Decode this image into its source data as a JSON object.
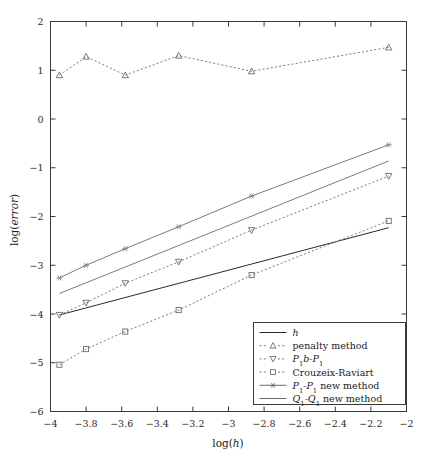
{
  "chart_data": {
    "type": "line",
    "title": "",
    "xlabel": "log(h)",
    "ylabel": "log(error)",
    "xlim": [
      -4,
      -2
    ],
    "ylim": [
      -6,
      2
    ],
    "xticks": [
      -4,
      -3.8,
      -3.6,
      -3.4,
      -3.2,
      -3,
      -2.8,
      -2.6,
      -2.4,
      -2.2,
      -2
    ],
    "xticklabels": [
      "-4",
      "-3.8",
      "-3.6",
      "-3.4",
      "-3.2",
      "-3",
      "-2.8",
      "-2.6",
      "-2.4",
      "-2.2",
      "-2"
    ],
    "yticks": [
      -6,
      -5,
      -4,
      -3,
      -2,
      -1,
      0,
      1,
      2
    ],
    "yticklabels": [
      "-6",
      "-5",
      "-4",
      "-3",
      "-2",
      "-1",
      "0",
      "1",
      "2"
    ],
    "grid": false,
    "legend_position": "lower right",
    "series": [
      {
        "name": "h",
        "label_plain": "h",
        "style": "solid",
        "marker": "none",
        "color": "#2b2b2b",
        "x": [
          -3.95,
          -2.1
        ],
        "y": [
          -4.02,
          -2.23
        ]
      },
      {
        "name": "penalty method",
        "label_plain": "penalty method",
        "style": "dashed",
        "marker": "triangle-up",
        "color": "#6b6b6b",
        "x": [
          -3.95,
          -3.8,
          -3.58,
          -3.28,
          -2.87,
          -2.1
        ],
        "y": [
          0.9,
          1.28,
          0.9,
          1.3,
          0.98,
          1.47
        ]
      },
      {
        "name": "P1b-P1",
        "label_plain": "P1b-P1",
        "style": "dashed",
        "marker": "triangle-down",
        "color": "#6b6b6b",
        "x": [
          -3.95,
          -3.8,
          -3.58,
          -3.28,
          -2.87,
          -2.1
        ],
        "y": [
          -4.02,
          -3.77,
          -3.37,
          -2.93,
          -2.28,
          -1.17
        ]
      },
      {
        "name": "Crouzeix-Raviart",
        "label_plain": "Crouzeix-Raviart",
        "style": "dashed",
        "marker": "square",
        "color": "#6b6b6b",
        "x": [
          -3.95,
          -3.8,
          -3.58,
          -3.28,
          -2.87,
          -2.1
        ],
        "y": [
          -5.04,
          -4.72,
          -4.36,
          -3.92,
          -3.2,
          -2.09
        ]
      },
      {
        "name": "P1-P1 new method",
        "label_plain": "P1-P1 new method",
        "style": "solid",
        "marker": "asterisk",
        "color": "#7a7a7a",
        "x": [
          -3.95,
          -3.8,
          -3.58,
          -3.28,
          -2.87,
          -2.1
        ],
        "y": [
          -3.26,
          -3.0,
          -2.66,
          -2.21,
          -1.58,
          -0.53
        ]
      },
      {
        "name": "Q1-Q1 new method",
        "label_plain": "Q1-Q1 new method",
        "style": "solid",
        "marker": "none",
        "color": "#7a7a7a",
        "x": [
          -3.95,
          -2.1
        ],
        "y": [
          -3.58,
          -0.86
        ]
      }
    ]
  },
  "legend": {
    "entries": [
      {
        "key": "h",
        "text_main": "h",
        "text_sub": "",
        "text_tail": "",
        "marker": "none",
        "style": "solid"
      },
      {
        "key": "penalty-method",
        "text_main": "penalty method",
        "text_sub": "",
        "text_tail": "",
        "marker": "triangle-up",
        "style": "dashed"
      },
      {
        "key": "p1b-p1",
        "text_main": "P",
        "text_sub": "1",
        "text_tail": "b-P",
        "text_tail_sub": "1",
        "marker": "triangle-down",
        "style": "dashed"
      },
      {
        "key": "crouzeix-raviart",
        "text_main": "Crouzeix-Raviart",
        "text_sub": "",
        "text_tail": "",
        "marker": "square",
        "style": "dashed"
      },
      {
        "key": "p1-p1-new-method",
        "text_main": "P",
        "text_sub": "1",
        "text_tail": "-P",
        "text_tail_sub": "1",
        "text_end": " new method",
        "marker": "asterisk",
        "style": "solid"
      },
      {
        "key": "q1-q1-new-method",
        "text_main": "Q",
        "text_sub": "1",
        "text_tail": "-Q",
        "text_tail_sub": "1",
        "text_end": " new method",
        "marker": "none",
        "style": "solid"
      }
    ]
  },
  "axes": {
    "x_label": "log(h)",
    "y_label": "log(error)"
  },
  "colors": {
    "frame": "#3a3a3a",
    "text": "#1c1c1c",
    "series_dark": "#2b2b2b",
    "series_gray": "#6b6b6b",
    "background": "#ffffff"
  }
}
